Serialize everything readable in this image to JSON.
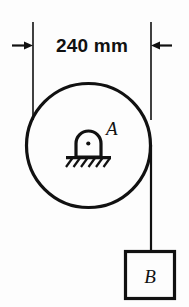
{
  "figure": {
    "background_color": "#fdfdfd",
    "stroke_color": "#111111"
  },
  "dimension": {
    "label": "240 mm",
    "value": 240,
    "unit": "mm",
    "orientation": "horizontal",
    "arrow_style": "outward-pointing-in",
    "extension_line_left_x": 33,
    "extension_line_right_x": 151,
    "extension_line_top_y": 22,
    "extension_line_bottom_y": 120
  },
  "pulley": {
    "label": "A",
    "shape": "circle",
    "center_x": 88.5,
    "center_y": 145.5,
    "radius": 62,
    "diameter_mm": 240
  },
  "support": {
    "type": "pin-support",
    "label": "A",
    "center_x": 88,
    "center_y": 143,
    "hatch_marks": 6,
    "ground_line_y": 157
  },
  "cord": {
    "from": "pulley-right-tangent",
    "to": "block-B-top",
    "x": 151,
    "top_y": 145,
    "bottom_y": 251
  },
  "block": {
    "label": "B",
    "shape": "square",
    "left": 125,
    "top": 251,
    "width": 50,
    "height": 48
  }
}
